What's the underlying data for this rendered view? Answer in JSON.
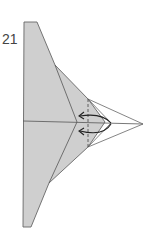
{
  "diagram": {
    "type": "origami-step",
    "step_number": "21",
    "colors": {
      "paper_fill": "#cfcfcf",
      "outline": "#555555",
      "dashed_line": "#444444",
      "arrow": "#222222",
      "background": "#ffffff"
    },
    "elements": [
      "paper-body",
      "center-crease",
      "upper-inner-fold",
      "lower-inner-fold",
      "front-flap",
      "valley-fold-dashed-line",
      "fold-arrow-upper",
      "fold-arrow-lower",
      "flap-outline-extended-tip"
    ]
  }
}
